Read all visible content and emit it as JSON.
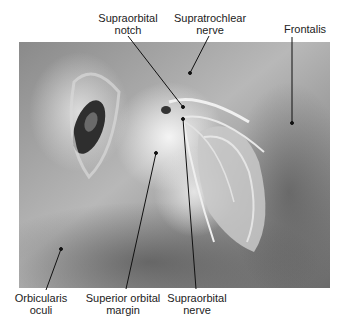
{
  "figure": {
    "labels": {
      "supraorbital_notch": {
        "line1": "Supraorbital",
        "line2": "notch"
      },
      "supratrochlear_nerve": {
        "line1": "Supratrochlear",
        "line2": "nerve"
      },
      "frontalis": {
        "line1": "Frontalis"
      },
      "orbicularis_oculi": {
        "line1": "Orbicularis",
        "line2": "oculi"
      },
      "superior_orbital_margin": {
        "line1": "Superior orbital",
        "line2": "margin"
      },
      "supraorbital_nerve": {
        "line1": "Supraorbital",
        "line2": "nerve"
      }
    },
    "colors": {
      "background": "#ffffff",
      "text": "#222222",
      "leader_line": "#111111"
    }
  }
}
